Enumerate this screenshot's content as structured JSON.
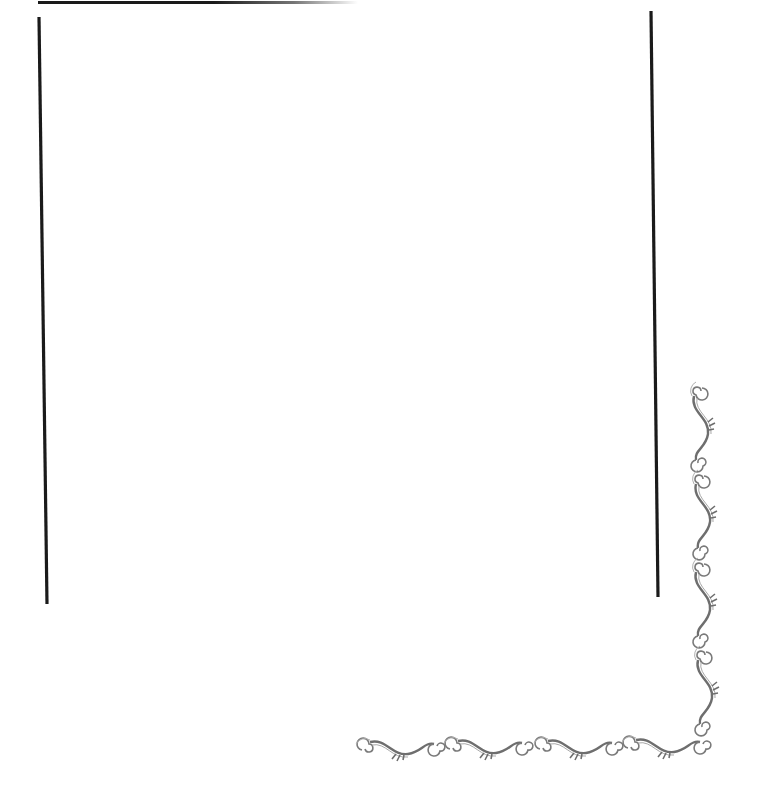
{
  "page": {
    "type": "decorative-frame",
    "background_color": "#ffffff",
    "line_color": "#1a1a1a",
    "ornament_color": "#6e6e6e"
  },
  "ornaments": {
    "right_column_count": 4,
    "bottom_row_count": 4
  }
}
